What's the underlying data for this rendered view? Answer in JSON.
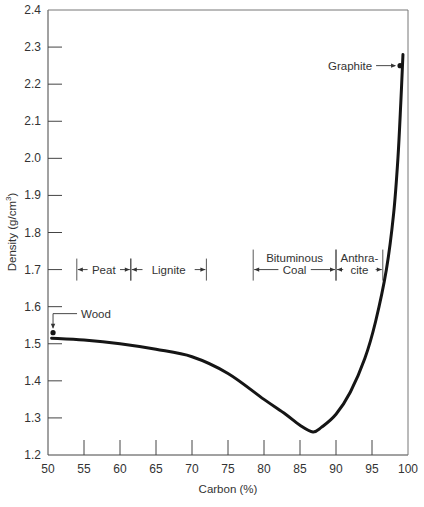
{
  "chart_data": {
    "type": "line",
    "title": "",
    "xlabel": "Carbon (%)",
    "ylabel": "Density (g/cm³)",
    "ylabel_base": "Density (g/cm",
    "ylabel_sup": "3",
    "ylabel_tail": ")",
    "xlim": [
      50,
      100
    ],
    "ylim": [
      1.2,
      2.4
    ],
    "grid": false,
    "legend": null,
    "x_ticks": [
      50,
      55,
      60,
      65,
      70,
      75,
      80,
      85,
      90,
      95,
      100
    ],
    "y_ticks": [
      1.2,
      1.3,
      1.4,
      1.5,
      1.6,
      1.7,
      1.8,
      1.9,
      2.0,
      2.1,
      2.2,
      2.3,
      2.4
    ],
    "x_tick_labels": [
      "50",
      "55",
      "60",
      "65",
      "70",
      "75",
      "80",
      "85",
      "90",
      "95",
      "100"
    ],
    "y_tick_labels": [
      "1.2",
      "1.3",
      "1.4",
      "1.5",
      "1.6",
      "1.7",
      "1.8",
      "1.9",
      "2.0",
      "2.1",
      "2.2",
      "2.3",
      "2.4"
    ],
    "series": [
      {
        "name": "Density vs carbon",
        "x": [
          50.5,
          55,
          60,
          65,
          70,
          75,
          80,
          83,
          85,
          86.8,
          88,
          90,
          92,
          94,
          95.5,
          97,
          98,
          98.6,
          99,
          99.3
        ],
        "y": [
          1.515,
          1.51,
          1.5,
          1.485,
          1.465,
          1.42,
          1.35,
          1.31,
          1.28,
          1.262,
          1.275,
          1.31,
          1.37,
          1.46,
          1.56,
          1.7,
          1.85,
          2.0,
          2.15,
          2.28
        ]
      }
    ],
    "points": [
      {
        "label": "Wood",
        "x": 50.7,
        "y": 1.53
      },
      {
        "label": "Graphite",
        "x": 98.9,
        "y": 2.25
      }
    ],
    "regions": [
      {
        "label": "Peat",
        "x_start": 54,
        "x_end": 61.5,
        "y": 1.7
      },
      {
        "label": "Lignite",
        "x_start": 61.5,
        "x_end": 72,
        "y": 1.7
      },
      {
        "label_line1": "Bituminous",
        "label_line2": "Coal",
        "x_start": 78.5,
        "x_end": 90,
        "y": 1.7
      },
      {
        "label_line1": "Anthra-",
        "label_line2": "cite",
        "x_start": 90,
        "x_end": 96.5,
        "y": 1.7
      }
    ]
  }
}
